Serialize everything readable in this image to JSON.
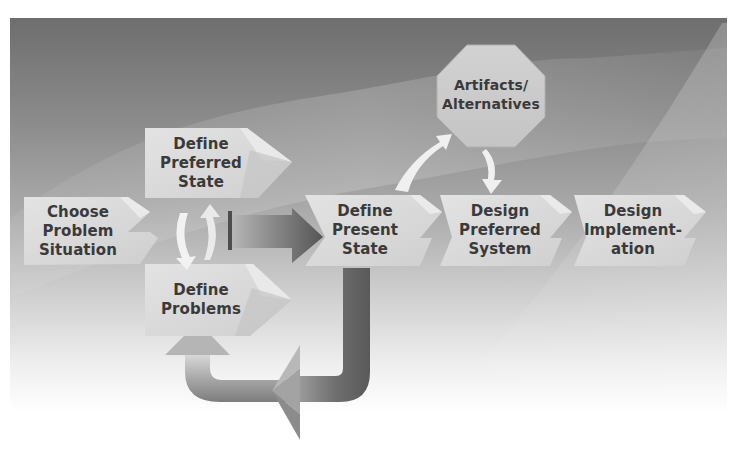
{
  "diagram": {
    "title": "",
    "nodes": [
      {
        "id": "choose",
        "label_lines": [
          "Choose",
          "Problem",
          "Situation"
        ]
      },
      {
        "id": "preferred_state",
        "label_lines": [
          "Define",
          "Preferred",
          "State"
        ]
      },
      {
        "id": "problems",
        "label_lines": [
          "Define",
          "Problems"
        ]
      },
      {
        "id": "present_state",
        "label_lines": [
          "Define",
          "Present",
          "State"
        ]
      },
      {
        "id": "artifacts",
        "label_lines": [
          "Artifacts/",
          "Alternatives"
        ],
        "shape": "octagon"
      },
      {
        "id": "preferred_system",
        "label_lines": [
          "Design",
          "Preferred",
          "System"
        ]
      },
      {
        "id": "implementation",
        "label_lines": [
          "Design",
          "Implement-",
          "ation"
        ]
      }
    ],
    "edges": [
      {
        "from": "preferred_state",
        "to": "problems",
        "style": "small-white-arrow"
      },
      {
        "from": "problems",
        "to": "preferred_state",
        "style": "small-white-arrow"
      },
      {
        "from": "preferred_state/problems",
        "to": "present_state",
        "style": "large-gray-arrow"
      },
      {
        "from": "present_state",
        "to": "artifacts",
        "style": "small-white-arrow"
      },
      {
        "from": "artifacts",
        "to": "preferred_system",
        "style": "small-white-arrow"
      },
      {
        "from": "present_state",
        "to": "problems",
        "style": "large-loop-arrow"
      }
    ],
    "colors": {
      "box_fill": "#d9d9d9",
      "box_tab": "#e6e6e6",
      "box_shade": "#bdbdbd",
      "text": "#3a3a3a",
      "arrow_dark": "#5e5e5e",
      "arrow_light": "#f2f2f2"
    }
  }
}
